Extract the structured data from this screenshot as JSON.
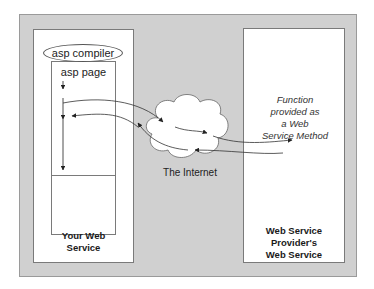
{
  "diagram": {
    "left": {
      "compiler_label": "asp compiler",
      "page_label": "asp page",
      "title_line1": "Your Web",
      "title_line2": "Service"
    },
    "cloud": {
      "label": "The Internet"
    },
    "right": {
      "function_line1": "Function",
      "function_line2": "provided as",
      "function_line3": "a Web",
      "function_line4": "Service Method",
      "title_line1": "Web Service",
      "title_line2": "Provider's",
      "title_line3": "Web Service"
    },
    "colors": {
      "panel": "#d0d0d0",
      "box": "#ffffff",
      "stroke": "#555555"
    }
  }
}
